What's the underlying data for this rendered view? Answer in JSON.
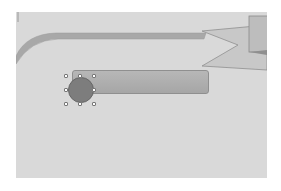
{
  "canvas": {
    "background": "#d9d9d9",
    "shapes": [
      {
        "id": "top-band",
        "type": "curved-band",
        "color": "#a8a8a8"
      },
      {
        "id": "arrow-shape",
        "type": "chevron-arrow",
        "color": "#c4c4c4"
      },
      {
        "id": "right-rect",
        "type": "rectangle",
        "color": "#bdbdbd"
      },
      {
        "id": "rounded-bar",
        "type": "rounded-rectangle",
        "color": "#b0b0b0"
      },
      {
        "id": "circle",
        "type": "ellipse",
        "color": "#7d7d7d",
        "selected": true
      }
    ]
  },
  "selection": {
    "handles": 8,
    "rotation_handle": true
  }
}
